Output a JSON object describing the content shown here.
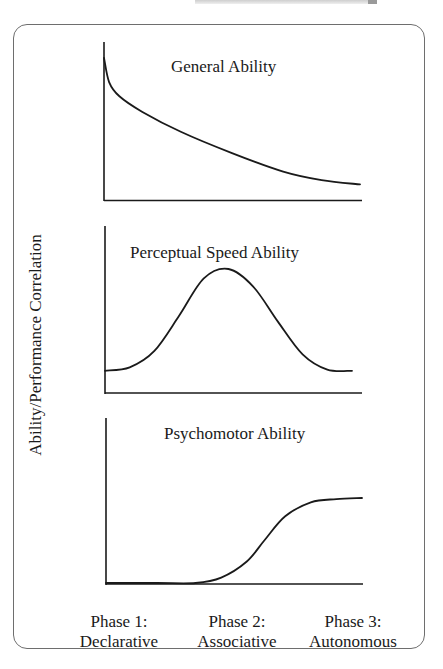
{
  "figure": {
    "y_axis_label": "Ability/Performance Correlation",
    "phases": [
      {
        "line1": "Phase 1:",
        "line2": "Declarative"
      },
      {
        "line1": "Phase 2:",
        "line2": "Associative"
      },
      {
        "line1": "Phase 3:",
        "line2": "Autonomous"
      }
    ],
    "panels": [
      {
        "title": "General Ability"
      },
      {
        "title": "Perceptual Speed Ability"
      },
      {
        "title": "Psychomotor Ability"
      }
    ],
    "colors": {
      "line": "#1a1a1a",
      "frame": "#6e6e6e",
      "background": "#ffffff"
    }
  },
  "chart_data": [
    {
      "type": "line",
      "title": "General Ability",
      "xlabel": "Phase of skill acquisition",
      "ylabel": "Ability/Performance Correlation",
      "x": [
        0,
        0.02,
        0.06,
        0.15,
        0.3,
        0.5,
        0.7,
        0.85,
        1.0
      ],
      "values": [
        1.0,
        0.83,
        0.73,
        0.62,
        0.48,
        0.33,
        0.2,
        0.14,
        0.11
      ],
      "grid": false,
      "ylim": [
        0,
        1.1
      ],
      "categories": [
        "Phase 1: Declarative",
        "Phase 2: Associative",
        "Phase 3: Autonomous"
      ]
    },
    {
      "type": "line",
      "title": "Perceptual Speed Ability",
      "xlabel": "Phase of skill acquisition",
      "ylabel": "Ability/Performance Correlation",
      "x": [
        0,
        0.1,
        0.2,
        0.3,
        0.4,
        0.5,
        0.6,
        0.7,
        0.8,
        0.9,
        1.0
      ],
      "values": [
        0.13,
        0.16,
        0.3,
        0.6,
        0.92,
        1.0,
        0.85,
        0.55,
        0.27,
        0.14,
        0.13
      ],
      "grid": false,
      "ylim": [
        0,
        1.1
      ],
      "categories": [
        "Phase 1: Declarative",
        "Phase 2: Associative",
        "Phase 3: Autonomous"
      ]
    },
    {
      "type": "line",
      "title": "Psychomotor Ability",
      "xlabel": "Phase of skill acquisition",
      "ylabel": "Ability/Performance Correlation",
      "x": [
        0,
        0.2,
        0.35,
        0.45,
        0.55,
        0.62,
        0.7,
        0.8,
        0.9,
        1.0
      ],
      "values": [
        0.0,
        0.0,
        0.0,
        0.05,
        0.2,
        0.4,
        0.62,
        0.75,
        0.78,
        0.79
      ],
      "grid": false,
      "ylim": [
        0,
        1.0
      ],
      "categories": [
        "Phase 1: Declarative",
        "Phase 2: Associative",
        "Phase 3: Autonomous"
      ]
    }
  ]
}
